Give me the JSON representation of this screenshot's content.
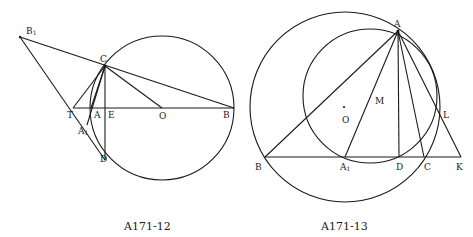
{
  "figures": [
    {
      "id": "fig12",
      "caption": "A171-12",
      "labels": {
        "B1": "B",
        "B1_sub": "1",
        "C": "C",
        "T": "T",
        "A": "A",
        "E": "E",
        "O": "O",
        "B": "B",
        "A1": "A",
        "A1_sub": "1",
        "D": "D"
      }
    },
    {
      "id": "fig13",
      "caption": "A171-13",
      "labels": {
        "A": "A",
        "M": "M",
        "O": "O",
        "L": "L",
        "B": "B",
        "A1": "A",
        "A1_sub": "1",
        "D": "D",
        "C": "C",
        "K": "K"
      }
    }
  ]
}
